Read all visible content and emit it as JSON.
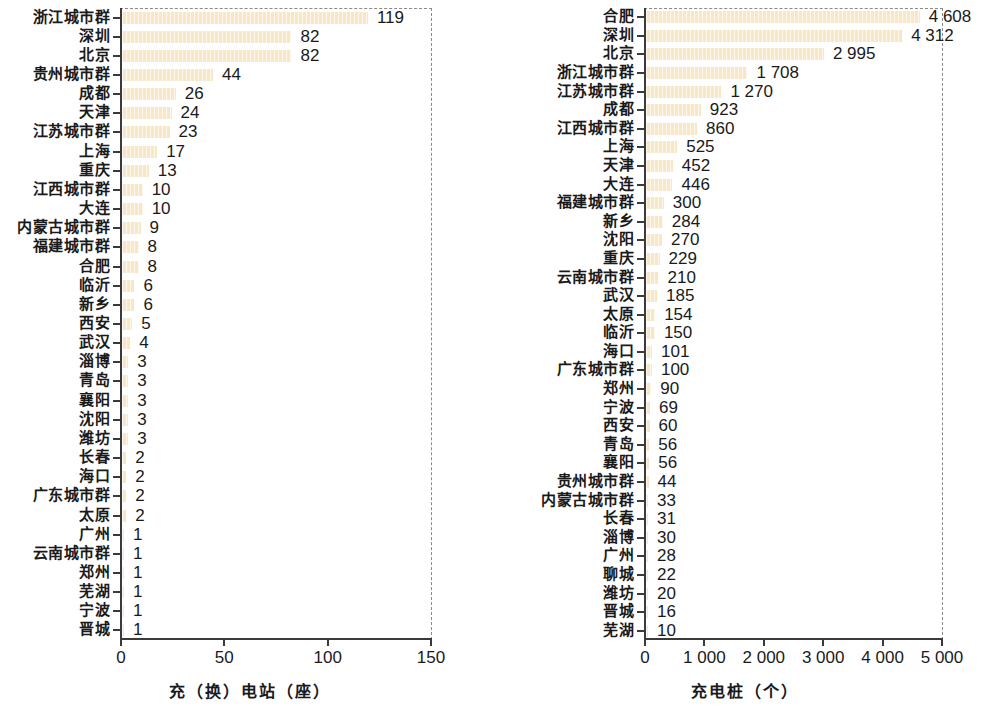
{
  "figure": {
    "background": "#ffffff",
    "bar_color": "#f7e7c4",
    "axis_color": "#3a3a3a",
    "dashed_color": "#8a8a8a"
  },
  "chart_data": [
    {
      "type": "bar",
      "orientation": "horizontal",
      "title": "",
      "xlabel": "充（换）电站（座）",
      "ylabel": "",
      "xlim": [
        0,
        150
      ],
      "xticks": [
        0,
        50,
        100,
        150
      ],
      "xticklabels": [
        "0",
        "50",
        "100",
        "150"
      ],
      "grid": false,
      "legend": null,
      "categories": [
        "浙江城市群",
        "深圳",
        "北京",
        "贵州城市群",
        "成都",
        "天津",
        "江苏城市群",
        "上海",
        "重庆",
        "江西城市群",
        "大连",
        "内蒙古城市群",
        "福建城市群",
        "合肥",
        "临沂",
        "新乡",
        "西安",
        "武汉",
        "淄博",
        "青岛",
        "襄阳",
        "沈阳",
        "潍坊",
        "长春",
        "海口",
        "广东城市群",
        "太原",
        "广州",
        "云南城市群",
        "郑州",
        "芜湖",
        "宁波",
        "晋城"
      ],
      "values": [
        119,
        82,
        82,
        44,
        26,
        24,
        23,
        17,
        13,
        10,
        10,
        9,
        8,
        8,
        6,
        6,
        5,
        4,
        3,
        3,
        3,
        3,
        3,
        2,
        2,
        2,
        2,
        1,
        1,
        1,
        1,
        1,
        1
      ],
      "value_labels": [
        "119",
        "82",
        "82",
        "44",
        "26",
        "24",
        "23",
        "17",
        "13",
        "10",
        "10",
        "9",
        "8",
        "8",
        "6",
        "6",
        "5",
        "4",
        "3",
        "3",
        "3",
        "3",
        "3",
        "2",
        "2",
        "2",
        "2",
        "1",
        "1",
        "1",
        "1",
        "1",
        "1"
      ]
    },
    {
      "type": "bar",
      "orientation": "horizontal",
      "title": "",
      "xlabel": "充电桩（个）",
      "ylabel": "",
      "xlim": [
        0,
        5000
      ],
      "xticks": [
        0,
        1000,
        2000,
        3000,
        4000,
        5000
      ],
      "xticklabels": [
        "0",
        "1 000",
        "2 000",
        "3 000",
        "4 000",
        "5 000"
      ],
      "grid": false,
      "legend": null,
      "categories": [
        "合肥",
        "深圳",
        "北京",
        "浙江城市群",
        "江苏城市群",
        "成都",
        "江西城市群",
        "上海",
        "天津",
        "大连",
        "福建城市群",
        "新乡",
        "沈阳",
        "重庆",
        "云南城市群",
        "武汉",
        "太原",
        "临沂",
        "海口",
        "广东城市群",
        "郑州",
        "宁波",
        "西安",
        "青岛",
        "襄阳",
        "贵州城市群",
        "内蒙古城市群",
        "长春",
        "淄博",
        "广州",
        "聊城",
        "潍坊",
        "晋城",
        "芜湖"
      ],
      "values": [
        4608,
        4312,
        2995,
        1708,
        1270,
        923,
        860,
        525,
        452,
        446,
        300,
        284,
        270,
        229,
        210,
        185,
        154,
        150,
        101,
        100,
        90,
        69,
        60,
        56,
        56,
        44,
        33,
        31,
        30,
        28,
        22,
        20,
        16,
        10
      ],
      "value_labels": [
        "4 608",
        "4 312",
        "2 995",
        "1 708",
        "1 270",
        "923",
        "860",
        "525",
        "452",
        "446",
        "300",
        "284",
        "270",
        "229",
        "210",
        "185",
        "154",
        "150",
        "101",
        "100",
        "90",
        "69",
        "60",
        "56",
        "56",
        "44",
        "33",
        "31",
        "30",
        "28",
        "22",
        "20",
        "16",
        "10"
      ]
    }
  ]
}
